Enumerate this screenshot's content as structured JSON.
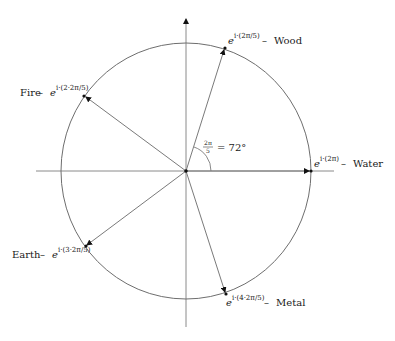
{
  "diagram": {
    "title": "",
    "colors": {
      "stroke": "#7a7a7a",
      "arrow": "#111111",
      "text": "#1a1a1a"
    },
    "angle_annotation": {
      "frac_num": "2π",
      "frac_den": "5",
      "rest": "= 72°"
    },
    "points": [
      {
        "name": "Water",
        "exp_base": "e",
        "exp_sup": "i·(2π)",
        "dash": " – ",
        "element": "Water"
      },
      {
        "name": "Wood",
        "exp_base": "e",
        "exp_sup": "i·(2π/5)",
        "dash": " – ",
        "element": "Wood"
      },
      {
        "name": "Fire",
        "exp_base": "e",
        "exp_sup": "i·(2·2π/5)",
        "dash": " – ",
        "element": "Fire"
      },
      {
        "name": "Earth",
        "exp_base": "e",
        "exp_sup": "i·(3·2π/5)",
        "dash": " – ",
        "element": "Earth"
      },
      {
        "name": "Metal",
        "exp_base": "e",
        "exp_sup": "i·(4·2π/5)",
        "dash": " – ",
        "element": "Metal"
      }
    ]
  }
}
